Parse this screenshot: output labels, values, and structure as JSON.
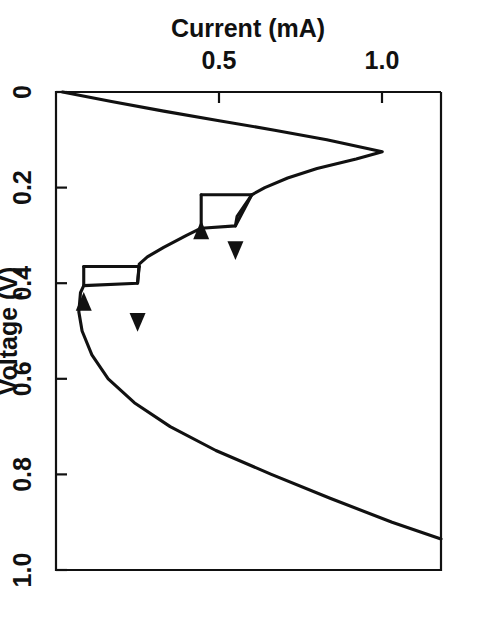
{
  "figure": {
    "background": "#ffffff",
    "ink_color": "#111111",
    "rotation_deg": 90,
    "note": "Plot is printed rotated 90 degrees clockwise on the page; tick labels and axis titles read bottom-to-top / upside-down."
  },
  "chart_data": {
    "type": "line",
    "title": "",
    "subtitle": "",
    "xlabel": "Voltage (V)",
    "ylabel": "Current (mA)",
    "xlim": [
      0.0,
      1.0
    ],
    "ylim": [
      0.0,
      1.18
    ],
    "grid": false,
    "legend": null,
    "xticks": [
      0,
      0.2,
      0.4,
      0.6,
      0.8,
      1.0
    ],
    "xticklabels": [
      "0",
      "0.2",
      "0.4",
      "0.6",
      "0.8",
      "1.0"
    ],
    "yticks": [
      0.5,
      1.0
    ],
    "yticklabels": [
      "0.5",
      "1.0"
    ],
    "series": [
      {
        "name": "forward-sweep",
        "direction": "increasing voltage",
        "points": [
          [
            0.0,
            0.02
          ],
          [
            0.02,
            0.17
          ],
          [
            0.04,
            0.33
          ],
          [
            0.06,
            0.5
          ],
          [
            0.08,
            0.67
          ],
          [
            0.1,
            0.83
          ],
          [
            0.125,
            1.0
          ],
          [
            0.14,
            0.92
          ],
          [
            0.16,
            0.8
          ],
          [
            0.18,
            0.71
          ],
          [
            0.2,
            0.64
          ],
          [
            0.215,
            0.6
          ],
          [
            0.26,
            0.555
          ],
          [
            0.28,
            0.55
          ],
          [
            0.285,
            0.445
          ],
          [
            0.3,
            0.4
          ],
          [
            0.325,
            0.33
          ],
          [
            0.345,
            0.28
          ],
          [
            0.36,
            0.255
          ],
          [
            0.4,
            0.25
          ],
          [
            0.405,
            0.085
          ],
          [
            0.42,
            0.075
          ],
          [
            0.46,
            0.07
          ],
          [
            0.5,
            0.08
          ],
          [
            0.55,
            0.11
          ],
          [
            0.6,
            0.16
          ],
          [
            0.65,
            0.24
          ],
          [
            0.7,
            0.35
          ],
          [
            0.75,
            0.49
          ],
          [
            0.8,
            0.66
          ],
          [
            0.85,
            0.84
          ],
          [
            0.9,
            1.03
          ],
          [
            0.935,
            1.18
          ]
        ]
      },
      {
        "name": "reverse-jump-upper",
        "direction": "decreasing voltage",
        "points": [
          [
            0.365,
            0.085
          ],
          [
            0.365,
            0.255
          ]
        ]
      },
      {
        "name": "reverse-jump-lower",
        "direction": "decreasing voltage",
        "points": [
          [
            0.215,
            0.445
          ],
          [
            0.215,
            0.6
          ]
        ]
      }
    ],
    "annotations": [
      {
        "type": "arrow",
        "label": "forward-arrow-lower-branch",
        "at": [
          0.32,
          0.55
        ],
        "direction": "increasing-voltage"
      },
      {
        "type": "arrow",
        "label": "reverse-arrow-lower-branch",
        "at": [
          0.3,
          0.445
        ],
        "direction": "decreasing-voltage"
      },
      {
        "type": "arrow",
        "label": "forward-arrow-upper-branch",
        "at": [
          0.47,
          0.25
        ],
        "direction": "increasing-voltage"
      },
      {
        "type": "arrow",
        "label": "reverse-arrow-upper-branch",
        "at": [
          0.45,
          0.085
        ],
        "direction": "decreasing-voltage"
      }
    ]
  }
}
